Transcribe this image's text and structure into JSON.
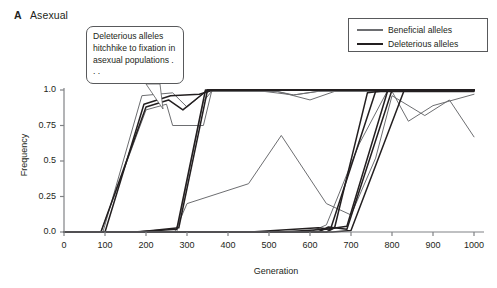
{
  "panel": {
    "letter": "A",
    "title": "Asexual"
  },
  "annotation": {
    "text": "Deleterious alleles hitchhike to fixation in asexual populations . . ."
  },
  "legend": {
    "position": "top-right",
    "entries": [
      {
        "label": "Beneficial alleles",
        "color": "#6d6e71"
      },
      {
        "label": "Deleterious alleles",
        "color": "#231f20"
      }
    ]
  },
  "chart_data": {
    "type": "line",
    "title": "Asexual",
    "xlabel": "Generation",
    "ylabel": "Frequency",
    "xlim": [
      0,
      1000
    ],
    "ylim": [
      0,
      1.0
    ],
    "xticks": [
      0,
      100,
      200,
      300,
      400,
      500,
      600,
      700,
      800,
      900,
      1000
    ],
    "xtick_labels": [
      "0",
      "100",
      "200",
      "300",
      "400",
      "500",
      "600",
      "700",
      "800",
      "900",
      "1000"
    ],
    "yticks": [
      0,
      0.25,
      0.5,
      0.75,
      1.0
    ],
    "ytick_labels": [
      "0.0",
      "0.25",
      "0.5",
      "0.75",
      "1.0"
    ],
    "grid": false,
    "series": [
      {
        "name": "Beneficial allele 1",
        "group": "Beneficial alleles",
        "color": "#6d6e71",
        "points": [
          [
            0,
            0.0
          ],
          [
            90,
            0.0
          ],
          [
            200,
            0.86
          ],
          [
            250,
            0.9
          ],
          [
            265,
            0.75
          ],
          [
            340,
            0.75
          ],
          [
            360,
            0.99
          ],
          [
            520,
            0.99
          ],
          [
            560,
            0.965
          ],
          [
            620,
            0.99
          ],
          [
            1000,
            0.99
          ]
        ]
      },
      {
        "name": "Beneficial allele 2",
        "group": "Beneficial alleles",
        "color": "#6d6e71",
        "points": [
          [
            0,
            0.0
          ],
          [
            95,
            0.0
          ],
          [
            190,
            0.96
          ],
          [
            265,
            0.98
          ],
          [
            300,
            0.88
          ],
          [
            350,
            1.0
          ],
          [
            460,
            1.0
          ],
          [
            560,
            0.965
          ],
          [
            640,
            1.0
          ],
          [
            1000,
            1.0
          ]
        ]
      },
      {
        "name": "Beneficial allele 3",
        "group": "Beneficial alleles",
        "color": "#6d6e71",
        "points": [
          [
            0,
            0.0
          ],
          [
            270,
            0.0
          ],
          [
            300,
            0.2
          ],
          [
            450,
            0.34
          ],
          [
            530,
            0.68
          ],
          [
            640,
            0.2
          ],
          [
            700,
            0.12
          ],
          [
            760,
            0.52
          ],
          [
            800,
            0.96
          ],
          [
            880,
            0.82
          ],
          [
            940,
            0.93
          ],
          [
            1000,
            0.67
          ]
        ]
      },
      {
        "name": "Beneficial allele 4",
        "group": "Beneficial alleles",
        "color": "#6d6e71",
        "points": [
          [
            0,
            0.0
          ],
          [
            275,
            0.0
          ],
          [
            340,
            0.92
          ],
          [
            360,
            0.99
          ],
          [
            520,
            0.99
          ],
          [
            600,
            0.93
          ],
          [
            660,
            0.99
          ],
          [
            800,
            0.99
          ],
          [
            840,
            0.78
          ],
          [
            900,
            0.89
          ],
          [
            1000,
            0.97
          ]
        ]
      },
      {
        "name": "Beneficial allele 5",
        "group": "Beneficial alleles",
        "color": "#6d6e71",
        "points": [
          [
            0,
            0.0
          ],
          [
            600,
            0.0
          ],
          [
            640,
            0.05
          ],
          [
            720,
            0.62
          ],
          [
            790,
            1.0
          ],
          [
            1000,
            1.0
          ]
        ]
      },
      {
        "name": "Deleterious allele 1",
        "group": "Deleterious alleles",
        "color": "#231f20",
        "points": [
          [
            0,
            0.0
          ],
          [
            90,
            0.0
          ],
          [
            200,
            0.88
          ],
          [
            255,
            0.93
          ],
          [
            290,
            0.86
          ],
          [
            350,
            1.0
          ],
          [
            1000,
            1.0
          ]
        ]
      },
      {
        "name": "Deleterious allele 2",
        "group": "Deleterious alleles",
        "color": "#231f20",
        "points": [
          [
            0,
            0.0
          ],
          [
            100,
            0.0
          ],
          [
            195,
            0.9
          ],
          [
            260,
            0.96
          ],
          [
            330,
            0.97
          ],
          [
            365,
            1.0
          ],
          [
            1000,
            1.0
          ]
        ]
      },
      {
        "name": "Deleterious allele 3",
        "group": "Deleterious alleles",
        "color": "#231f20",
        "points": [
          [
            0,
            0.0
          ],
          [
            170,
            0.0
          ],
          [
            275,
            0.02
          ],
          [
            345,
            1.0
          ],
          [
            1000,
            1.0
          ]
        ]
      },
      {
        "name": "Deleterious allele 4",
        "group": "Deleterious alleles",
        "color": "#231f20",
        "points": [
          [
            0,
            0.0
          ],
          [
            180,
            0.0
          ],
          [
            280,
            0.03
          ],
          [
            350,
            1.0
          ],
          [
            1000,
            1.0
          ]
        ]
      },
      {
        "name": "Deleterious allele 5",
        "group": "Deleterious alleles",
        "color": "#231f20",
        "points": [
          [
            0,
            0.0
          ],
          [
            455,
            0.0
          ],
          [
            620,
            0.03
          ],
          [
            650,
            0.02
          ],
          [
            760,
            0.99
          ],
          [
            1000,
            0.99
          ]
        ]
      },
      {
        "name": "Deleterious allele 6",
        "group": "Deleterious alleles",
        "color": "#231f20",
        "points": [
          [
            0,
            0.0
          ],
          [
            530,
            0.0
          ],
          [
            640,
            0.02
          ],
          [
            690,
            0.04
          ],
          [
            790,
            1.0
          ],
          [
            1000,
            1.0
          ]
        ]
      },
      {
        "name": "Deleterious allele 7",
        "group": "Deleterious alleles",
        "color": "#231f20",
        "points": [
          [
            0,
            0.0
          ],
          [
            620,
            0.0
          ],
          [
            645,
            0.035
          ],
          [
            690,
            0.02
          ],
          [
            800,
            1.0
          ],
          [
            1000,
            1.0
          ]
        ]
      },
      {
        "name": "Deleterious allele 8",
        "group": "Deleterious alleles",
        "color": "#231f20",
        "points": [
          [
            0,
            0.0
          ],
          [
            640,
            0.0
          ],
          [
            660,
            0.03
          ],
          [
            740,
            0.98
          ],
          [
            800,
            1.0
          ],
          [
            1000,
            1.0
          ]
        ]
      },
      {
        "name": "Deleterious allele 9",
        "group": "Deleterious alleles",
        "color": "#231f20",
        "points": [
          [
            0,
            0.0
          ],
          [
            655,
            0.0
          ],
          [
            700,
            0.01
          ],
          [
            830,
            1.0
          ],
          [
            1000,
            1.0
          ]
        ]
      }
    ]
  }
}
